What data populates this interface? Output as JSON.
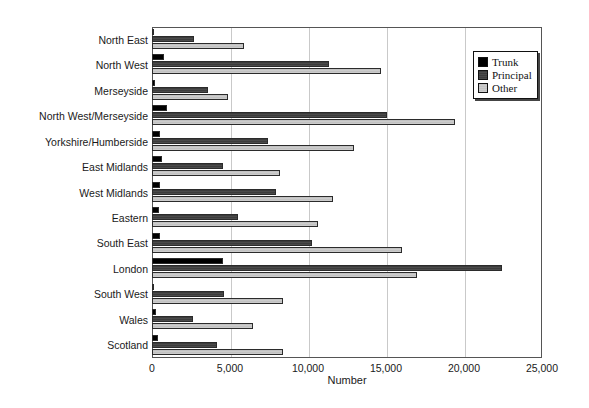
{
  "chart_data": {
    "type": "bar",
    "orientation": "horizontal",
    "title": "",
    "xlabel": "Number",
    "ylabel": "",
    "xlim": [
      0,
      25000
    ],
    "xticks": [
      0,
      5000,
      10000,
      15000,
      20000,
      25000
    ],
    "xtick_labels": [
      "0",
      "5,000",
      "10,000",
      "15,000",
      "20,000",
      "25,000"
    ],
    "grid": "vertical",
    "legend_position": "top-right",
    "categories": [
      "North East",
      "North West",
      "Merseyside",
      "North West/Merseyside",
      "Yorkshire/Humberside",
      "East Midlands",
      "West Midlands",
      "Eastern",
      "South East",
      "London",
      "South West",
      "Wales",
      "Scotland"
    ],
    "series": [
      {
        "name": "Trunk",
        "color": "#000000",
        "values": [
          100,
          770,
          170,
          960,
          510,
          650,
          510,
          450,
          510,
          4570,
          130,
          260,
          400
        ]
      },
      {
        "name": "Principal",
        "color": "#4a4a4a",
        "values": [
          2700,
          11350,
          3600,
          15050,
          7450,
          4570,
          7950,
          5530,
          10270,
          22450,
          4600,
          2650,
          4150
        ]
      },
      {
        "name": "Other",
        "color": "#c8c8c8",
        "values": [
          5900,
          14700,
          4850,
          19400,
          12950,
          8200,
          11620,
          10630,
          16000,
          16970,
          8380,
          6450,
          8400
        ]
      }
    ]
  },
  "legend": {
    "items": [
      {
        "label": "Trunk",
        "swatch": "black-square-icon"
      },
      {
        "label": "Principal",
        "swatch": "dark-gray-square-icon"
      },
      {
        "label": "Other",
        "swatch": "light-gray-square-icon"
      }
    ]
  }
}
